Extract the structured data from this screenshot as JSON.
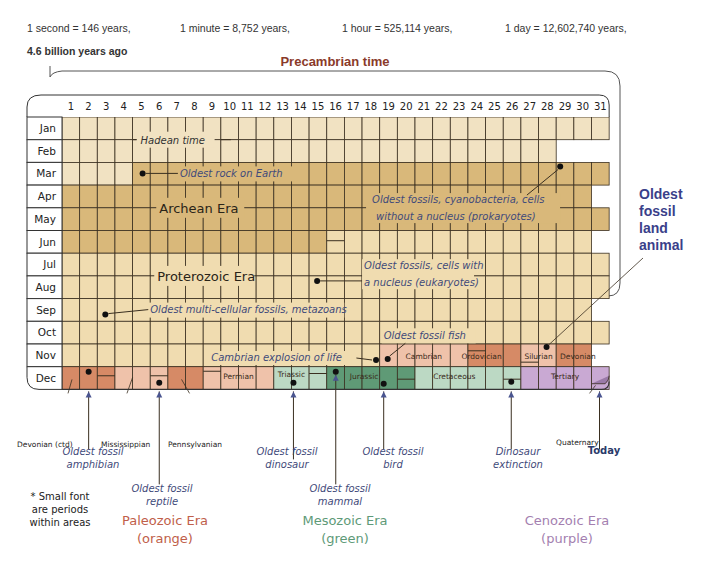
{
  "scale": {
    "second": "1 second = 146 years,",
    "minute": "1 minute = 8,752 years,",
    "hour": "1 hour = 525,114 years,",
    "day": "1 day = 12,602,740 years,"
  },
  "start_label": "4.6 billion years ago",
  "precambrian_title": "Precambrian time",
  "calendar": {
    "months": [
      "Jan",
      "Feb",
      "Mar",
      "Apr",
      "May",
      "Jun",
      "Jul",
      "Aug",
      "Sep",
      "Oct",
      "Nov",
      "Dec"
    ],
    "days": [
      "1",
      "2",
      "3",
      "4",
      "5",
      "6",
      "7",
      "8",
      "9",
      "10",
      "11",
      "12",
      "13",
      "14",
      "15",
      "16",
      "17",
      "18",
      "19",
      "20",
      "21",
      "22",
      "23",
      "24",
      "25",
      "26",
      "27",
      "28",
      "29",
      "30",
      "31"
    ],
    "eras_in_grid": {
      "hadean": "Hadean time",
      "archean": "Archean Era",
      "proterozoic": "Proterozoic Era"
    },
    "periods": {
      "permian": "Permian",
      "triassic": "Triassic",
      "jurassic": "Jurassic",
      "cretaceous": "Cretaceous",
      "tertiary": "Tertiary",
      "cambrian": "Cambrian",
      "ordovician": "Ordovician",
      "silurian": "Silurian",
      "devonian": "Devonian"
    }
  },
  "grid_annotations": {
    "oldest_rock": "Oldest rock on Earth",
    "prokaryotes_1": "Oldest fossils, cyanobacteria, cells",
    "prokaryotes_2": "without a nucleus (prokaryotes)",
    "eukaryotes_1": "Oldest fossils, cells with",
    "eukaryotes_2": "a nucleus (eukaryotes)",
    "metazoans": "Oldest multi-cellular fossils, metazoans",
    "fish": "Oldest fossil fish",
    "cambrian_explosion": "Cambrian explosion of life"
  },
  "below_periods": {
    "devonian_ctd": "Devonian (ctd)",
    "mississippian": "Mississippian",
    "pennsylvanian": "Pennsylvanian",
    "quaternary": "Quaternary"
  },
  "below_annotations": {
    "amphibian": [
      "Oldest fossil",
      "amphibian"
    ],
    "reptile": [
      "Oldest fossil",
      "reptile"
    ],
    "dinosaur": [
      "Oldest fossil",
      "dinosaur"
    ],
    "mammal": [
      "Oldest fossil",
      "mammal"
    ],
    "bird": [
      "Oldest fossil",
      "bird"
    ],
    "extinction": [
      "Dinosaur",
      "extinction"
    ],
    "today": "Today"
  },
  "land_animal": [
    "Oldest",
    "fossil",
    "land",
    "animal"
  ],
  "legend": {
    "note": [
      "* Small font",
      "are periods",
      "within areas"
    ],
    "paleozoic": [
      "Paleozoic Era",
      "(orange)"
    ],
    "mesozoic": [
      "Mesozoic Era",
      "(green)"
    ],
    "cenozoic": [
      "Cenozoic Era",
      "(purple)"
    ]
  },
  "colors": {
    "hadean": "#f1e2c2",
    "archean": "#d9b87a",
    "proterozoic": "#f0dcb0",
    "paleozoic_light": "#efc2aa",
    "paleozoic_dark": "#d68a66",
    "mesozoic_light": "#bcd9c4",
    "mesozoic_dark": "#5f9a76",
    "cenozoic": "#c9a9d3",
    "annotation": "#3f4a7a",
    "paleozoic_text": "#c0604a",
    "mesozoic_text": "#5e9a78",
    "cenozoic_text": "#a47fb0"
  }
}
